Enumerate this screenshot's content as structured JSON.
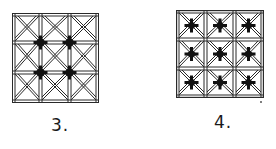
{
  "figures": [
    {
      "id": "3",
      "label": "3.",
      "grid": [
        3,
        3
      ],
      "cell_borders": "double-line",
      "cell_diagonals": "double-line X",
      "star_positions": "interior grid intersections (4)",
      "star_count": 4
    },
    {
      "id": "4",
      "label": "4.",
      "grid": [
        3,
        3
      ],
      "cell_borders": "double-line",
      "cell_diagonals": "double-line X",
      "star_positions": "cell centers (9)",
      "star_count": 9
    }
  ],
  "colors": {
    "line": "#2a2a2a",
    "star": "#111111",
    "background": "#ffffff"
  }
}
